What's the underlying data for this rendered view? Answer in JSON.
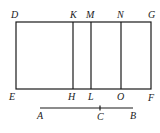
{
  "diagram": {
    "type": "geometric-figure",
    "rectangle": {
      "corners": {
        "top_left": "D",
        "top_right": "G",
        "bottom_left": "E",
        "bottom_right": "F"
      },
      "x1": 16,
      "y1": 22,
      "x2": 151,
      "y2": 89
    },
    "dividers": [
      {
        "top": "K",
        "bottom": "H",
        "x": 73
      },
      {
        "top": "M",
        "bottom": "L",
        "x": 91
      },
      {
        "top": "N",
        "bottom": "O",
        "x": 121
      }
    ],
    "segment": {
      "start": "A",
      "point": "C",
      "end": "B",
      "x1": 40,
      "xc": 100,
      "x2": 133,
      "y": 108
    },
    "labels": {
      "D": "D",
      "K": "K",
      "M": "M",
      "N": "N",
      "G": "G",
      "E": "E",
      "H": "H",
      "L": "L",
      "O": "O",
      "F": "F",
      "A": "A",
      "C": "C",
      "B": "B"
    },
    "colors": {
      "stroke": "#1a1a1a",
      "background": "#ffffff"
    }
  }
}
